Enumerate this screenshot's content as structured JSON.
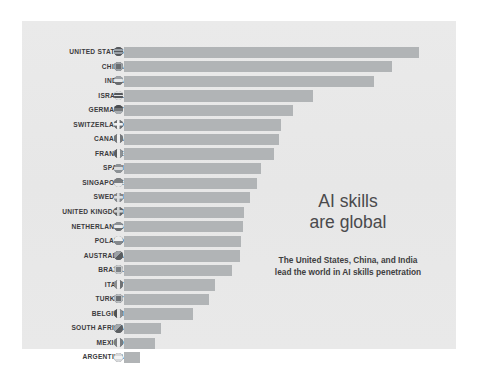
{
  "figure": {
    "background_color": "#ffffff",
    "panel_color": "#e9e9e9",
    "bar_color": "#b1b4b6",
    "label_color": "#3b3b3d"
  },
  "callout": {
    "title_line1": "AI skills",
    "title_line2": "are global",
    "subtitle_line1": "The United States, China, and India",
    "subtitle_line2": "lead the world in AI skills penetration"
  },
  "chart_data": {
    "type": "bar",
    "orientation": "horizontal",
    "title": "AI skills are global",
    "subtitle": "The United States, China, and India lead the world in AI skills penetration",
    "xlabel": "",
    "ylabel": "",
    "grid": false,
    "legend": false,
    "axis_ticks_visible": false,
    "value_labels_visible": false,
    "xlim": [
      0,
      2.0
    ],
    "categories": [
      "UNITED STATES",
      "CHINA",
      "INDIA",
      "ISRAEL",
      "GERMANY",
      "SWITZERLAND",
      "CANADA",
      "FRANCE",
      "SPAIN",
      "SINGAPORE",
      "SWEDEN",
      "UNITED KINGDOM",
      "NETHERLANDS",
      "POLAND",
      "AUSTRALIA",
      "BRAZIL",
      "ITALY",
      "TURKEY",
      "BELGIUM",
      "SOUTH AFRICA",
      "MEXICO",
      "ARGENTINA"
    ],
    "values": [
      2.0,
      1.83,
      1.71,
      1.29,
      1.15,
      1.07,
      1.06,
      1.02,
      0.93,
      0.91,
      0.86,
      0.82,
      0.81,
      0.8,
      0.79,
      0.74,
      0.62,
      0.58,
      0.47,
      0.25,
      0.21,
      0.11
    ],
    "bar_pixel_widths": [
      295,
      268,
      250,
      189,
      169,
      157,
      155,
      150,
      137,
      133,
      126,
      120,
      119,
      117,
      116,
      108,
      91,
      85,
      69,
      37,
      31,
      16
    ],
    "flag_icon_names": [
      "flag-icon-united-states",
      "flag-icon-china",
      "flag-icon-india",
      "flag-icon-israel",
      "flag-icon-germany",
      "flag-icon-switzerland",
      "flag-icon-canada",
      "flag-icon-france",
      "flag-icon-spain",
      "flag-icon-singapore",
      "flag-icon-sweden",
      "flag-icon-united-kingdom",
      "flag-icon-netherlands",
      "flag-icon-poland",
      "flag-icon-australia",
      "flag-icon-brazil",
      "flag-icon-italy",
      "flag-icon-turkey",
      "flag-icon-belgium",
      "flag-icon-south-africa",
      "flag-icon-mexico",
      "flag-icon-argentina"
    ]
  }
}
